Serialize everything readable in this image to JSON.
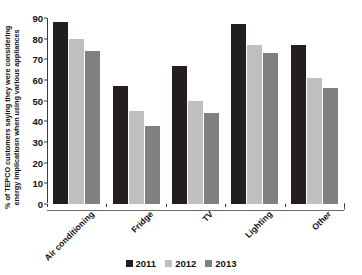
{
  "chart_data": {
    "type": "bar",
    "title": "",
    "subtitle": "",
    "xlabel": "",
    "ylabel_lines": [
      "% of TEPCO customers saying they were considering",
      "energy implicatiosn when using various appliances"
    ],
    "ylabel": "% of TEPCO customers saying they were considering energy implicatiosn when using various appliances",
    "categories": [
      "Air conditioning",
      "Fridge",
      "TV",
      "Lighting",
      "Other"
    ],
    "series": [
      {
        "name": "2011",
        "color": "#231f20",
        "values": [
          87,
          56,
          66,
          86,
          76
        ]
      },
      {
        "name": "2012",
        "color": "#bfbfbf",
        "values": [
          79,
          44,
          49,
          76,
          60
        ]
      },
      {
        "name": "2013",
        "color": "#808080",
        "values": [
          73,
          37,
          43,
          72,
          55
        ]
      }
    ],
    "ylim": [
      0,
      90
    ],
    "ytick_values": [
      0,
      10,
      20,
      30,
      40,
      50,
      60,
      70,
      80,
      90
    ],
    "ytick_labels": [
      "0",
      "10",
      "20",
      "30",
      "40",
      "50",
      "60",
      "70",
      "80",
      "90"
    ],
    "grid": false,
    "legend_position": "bottom",
    "legend_entries": [
      "2011",
      "2012",
      "2013"
    ],
    "annotations": []
  }
}
